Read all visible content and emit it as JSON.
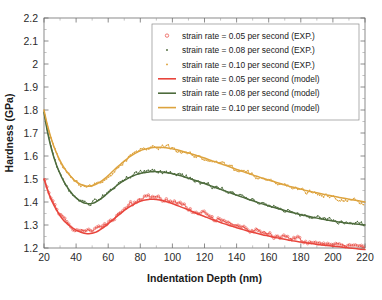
{
  "chart_data": {
    "type": "line",
    "title": "",
    "xlabel": "Indentation Depth (nm)",
    "ylabel": "Hardness (GPa)",
    "xlim": [
      20,
      220
    ],
    "ylim": [
      1.2,
      2.2
    ],
    "xticks": [
      20,
      40,
      60,
      80,
      100,
      120,
      140,
      160,
      180,
      200,
      220
    ],
    "xtick_labels": [
      "20",
      "40",
      "60",
      "80",
      "100",
      "120",
      "140",
      "160",
      "180",
      "200",
      "220"
    ],
    "yticks": [
      1.2,
      1.3,
      1.4,
      1.5,
      1.6,
      1.7,
      1.8,
      1.9,
      2.0,
      2.1,
      2.2
    ],
    "ytick_labels": [
      "1.2",
      "1.3",
      "1.4",
      "1.5",
      "1.6",
      "1.7",
      "1.8",
      "1.9",
      "2",
      "2.1",
      "2.2"
    ],
    "grid": false,
    "minor_ticks": true,
    "legend_position": "upper right",
    "colors": {
      "rate_005": "#E8453C",
      "rate_008": "#4D6B3C",
      "rate_010": "#DDA33E"
    },
    "legend": [
      {
        "label": "strain rate = 0.05 per second (EXP.)",
        "marker": "open-circle",
        "color": "#E8453C",
        "style": "marker"
      },
      {
        "label": "strain rate = 0.08 per second (EXP.)",
        "marker": "dot",
        "color": "#4D6B3C",
        "style": "marker"
      },
      {
        "label": "strain rate = 0.10 per second (EXP.)",
        "marker": "dot",
        "color": "#DDA33E",
        "style": "marker"
      },
      {
        "label": "strain rate = 0.05 per second (model)",
        "marker": "line",
        "color": "#E8453C",
        "style": "line"
      },
      {
        "label": "strain rate = 0.08 per second (model)",
        "marker": "line",
        "color": "#4D6B3C",
        "style": "line"
      },
      {
        "label": "strain rate = 0.10 per second (model)",
        "marker": "line",
        "color": "#DDA33E",
        "style": "line"
      }
    ],
    "x": [
      20,
      22,
      24,
      26,
      28,
      30,
      32,
      34,
      36,
      38,
      40,
      42,
      44,
      46,
      48,
      50,
      52,
      54,
      56,
      58,
      60,
      62,
      64,
      66,
      68,
      70,
      72,
      74,
      76,
      78,
      80,
      82,
      84,
      86,
      88,
      90,
      92,
      94,
      96,
      98,
      100,
      104,
      108,
      112,
      116,
      120,
      124,
      128,
      132,
      136,
      140,
      144,
      148,
      152,
      156,
      160,
      164,
      168,
      172,
      176,
      180,
      184,
      188,
      192,
      196,
      200,
      204,
      208,
      212,
      216,
      220
    ],
    "series": [
      {
        "name": "strain rate = 0.05 per second (model)",
        "color": "#E8453C",
        "values": [
          1.5,
          1.455,
          1.418,
          1.388,
          1.362,
          1.34,
          1.322,
          1.308,
          1.296,
          1.286,
          1.278,
          1.271,
          1.266,
          1.263,
          1.262,
          1.264,
          1.268,
          1.275,
          1.284,
          1.294,
          1.305,
          1.317,
          1.329,
          1.341,
          1.352,
          1.363,
          1.373,
          1.382,
          1.39,
          1.397,
          1.403,
          1.407,
          1.41,
          1.412,
          1.412,
          1.411,
          1.409,
          1.406,
          1.402,
          1.398,
          1.393,
          1.382,
          1.371,
          1.359,
          1.348,
          1.337,
          1.326,
          1.316,
          1.306,
          1.297,
          1.288,
          1.28,
          1.272,
          1.265,
          1.258,
          1.252,
          1.246,
          1.24,
          1.235,
          1.23,
          1.226,
          1.222,
          1.218,
          1.214,
          1.211,
          1.208,
          1.205,
          1.202,
          1.199,
          1.196,
          1.193
        ]
      },
      {
        "name": "strain rate = 0.08 per second (model)",
        "color": "#4D6B3C",
        "values": [
          1.79,
          1.71,
          1.648,
          1.598,
          1.557,
          1.523,
          1.494,
          1.47,
          1.449,
          1.432,
          1.418,
          1.407,
          1.399,
          1.394,
          1.392,
          1.394,
          1.399,
          1.407,
          1.417,
          1.428,
          1.44,
          1.452,
          1.464,
          1.475,
          1.485,
          1.494,
          1.502,
          1.509,
          1.515,
          1.52,
          1.524,
          1.527,
          1.529,
          1.531,
          1.532,
          1.532,
          1.531,
          1.53,
          1.528,
          1.526,
          1.523,
          1.516,
          1.508,
          1.499,
          1.49,
          1.48,
          1.47,
          1.46,
          1.45,
          1.44,
          1.43,
          1.42,
          1.41,
          1.401,
          1.392,
          1.383,
          1.375,
          1.367,
          1.359,
          1.352,
          1.345,
          1.339,
          1.333,
          1.327,
          1.322,
          1.317,
          1.313,
          1.309,
          1.306,
          1.303,
          1.3
        ]
      },
      {
        "name": "strain rate = 0.10 per second (model)",
        "color": "#DDA33E",
        "values": [
          1.8,
          1.738,
          1.687,
          1.645,
          1.61,
          1.58,
          1.555,
          1.534,
          1.516,
          1.501,
          1.489,
          1.48,
          1.474,
          1.47,
          1.469,
          1.471,
          1.476,
          1.483,
          1.492,
          1.503,
          1.515,
          1.528,
          1.541,
          1.554,
          1.566,
          1.578,
          1.589,
          1.599,
          1.608,
          1.616,
          1.623,
          1.628,
          1.632,
          1.635,
          1.637,
          1.638,
          1.638,
          1.637,
          1.636,
          1.634,
          1.631,
          1.625,
          1.617,
          1.609,
          1.6,
          1.591,
          1.581,
          1.572,
          1.562,
          1.552,
          1.542,
          1.532,
          1.523,
          1.513,
          1.504,
          1.495,
          1.487,
          1.478,
          1.47,
          1.463,
          1.456,
          1.449,
          1.443,
          1.437,
          1.431,
          1.425,
          1.42,
          1.415,
          1.41,
          1.405,
          1.4
        ]
      }
    ],
    "experimental_series": [
      {
        "name": "strain rate = 0.05 per second (EXP.)",
        "color": "#E8453C",
        "marker": "open-circle",
        "noise": 0.013,
        "offset": 0.012
      },
      {
        "name": "strain rate = 0.08 per second (EXP.)",
        "color": "#4D6B3C",
        "marker": "dot",
        "noise": 0.012,
        "offset": 0.004
      },
      {
        "name": "strain rate = 0.10 per second (EXP.)",
        "color": "#DDA33E",
        "marker": "dot",
        "noise": 0.013,
        "offset": -0.004
      }
    ]
  }
}
